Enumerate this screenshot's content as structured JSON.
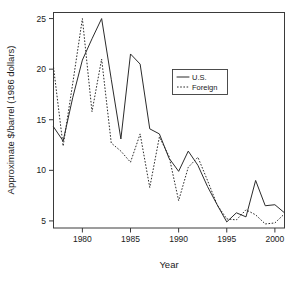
{
  "chart_data": {
    "type": "line",
    "title": "",
    "xlabel": "Year",
    "ylabel": "Approximate $/barrel (1986 dollars)",
    "xlim": [
      1977,
      2001
    ],
    "ylim": [
      4.3,
      25.6
    ],
    "grid": false,
    "legend_position": "upper-right",
    "xticks": [
      1980,
      1985,
      1990,
      1995,
      2000
    ],
    "xtick_labels": [
      "1980",
      "1985",
      "1990",
      "1995",
      "2000"
    ],
    "yticks": [
      5,
      10,
      15,
      20,
      25
    ],
    "ytick_labels": [
      "5",
      "10",
      "15",
      "20",
      "25"
    ],
    "x": [
      1977,
      1978,
      1979,
      1980,
      1981,
      1982,
      1983,
      1984,
      1985,
      1986,
      1987,
      1988,
      1989,
      1990,
      1991,
      1992,
      1993,
      1994,
      1995,
      1996,
      1997,
      1998,
      1999,
      2000,
      2001
    ],
    "series": [
      {
        "name": "U.S.",
        "style": "solid",
        "color": "#2b2b2b",
        "values": [
          14.3,
          12.9,
          17.2,
          20.9,
          23.0,
          25.0,
          19.0,
          13.1,
          21.5,
          20.5,
          14.1,
          13.6,
          11.2,
          9.9,
          11.9,
          10.5,
          8.4,
          6.6,
          4.9,
          5.8,
          5.4,
          9.0,
          6.5,
          6.6,
          5.8
        ]
      },
      {
        "name": "Foreign",
        "style": "dashed",
        "color": "#2b2b2b",
        "values": [
          20.2,
          12.4,
          18.6,
          25.0,
          15.8,
          21.0,
          12.7,
          11.9,
          10.8,
          13.6,
          8.3,
          13.3,
          11.4,
          7.0,
          10.3,
          11.3,
          9.0,
          6.6,
          5.2,
          5.1,
          6.1,
          5.6,
          4.7,
          4.8,
          5.7
        ]
      }
    ]
  },
  "legend": {
    "entries": [
      {
        "label": "U.S.",
        "style": "solid"
      },
      {
        "label": "Foreign",
        "style": "dashed"
      }
    ]
  },
  "axes": {
    "x_title": "Year",
    "y_title": "Approximate $/barrel (1986 dollars)"
  }
}
